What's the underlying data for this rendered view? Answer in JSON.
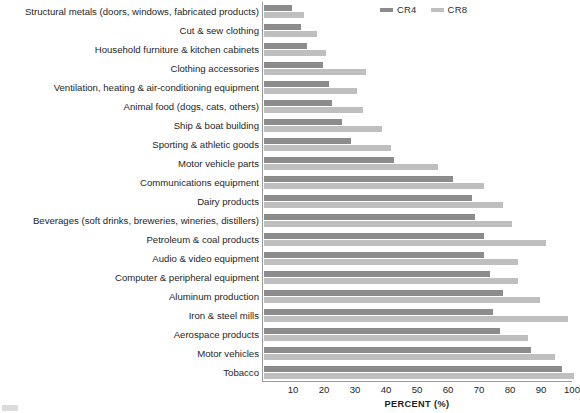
{
  "chart_data": {
    "type": "bar",
    "orientation": "horizontal",
    "title": "",
    "xlabel": "PERCENT (%)",
    "ylabel": "",
    "xlim": [
      0,
      100
    ],
    "xticks": [
      10,
      20,
      30,
      40,
      50,
      60,
      70,
      80,
      90,
      100
    ],
    "grid": false,
    "legend_position": "top-right",
    "colors": {
      "CR4": "#8c8c8c",
      "CR8": "#bfbfbf",
      "axis": "#9a9a9a",
      "text": "#262626"
    },
    "categories": [
      "Structural metals (doors, windows, fabricated products)",
      "Cut & sew clothing",
      "Household furniture & kitchen cabinets",
      "Clothing accessories",
      "Ventilation, heating & air-conditioning equipment",
      "Animal food (dogs, cats, others)",
      "Ship & boat building",
      "Sporting & athletic goods",
      "Motor vehicle parts",
      "Communications equipment",
      "Dairy products",
      "Beverages (soft drinks, breweries, wineries, distillers)",
      "Petroleum & coal products",
      "Audio & video equipment",
      "Computer & peripheral equipment",
      "Aluminum production",
      "Iron & steel mills",
      "Aerospace products",
      "Motor vehicles",
      "Tobacco"
    ],
    "series": [
      {
        "name": "CR4",
        "color": "#8c8c8c",
        "values": [
          9,
          12,
          14,
          19,
          21,
          22,
          25,
          28,
          42,
          61,
          67,
          68,
          71,
          71,
          73,
          77,
          74,
          76,
          86,
          96
        ]
      },
      {
        "name": "CR8",
        "color": "#bfbfbf",
        "values": [
          13,
          17,
          20,
          33,
          30,
          32,
          38,
          41,
          56,
          71,
          77,
          80,
          91,
          82,
          82,
          89,
          98,
          85,
          94,
          100
        ]
      }
    ]
  },
  "legend": {
    "entries": [
      {
        "label": "CR4",
        "color": "#8c8c8c"
      },
      {
        "label": "CR8",
        "color": "#bfbfbf"
      }
    ]
  },
  "axis": {
    "x_title": "PERCENT (%)",
    "x_tick_labels": [
      "10",
      "20",
      "30",
      "40",
      "50",
      "60",
      "70",
      "80",
      "90",
      "100"
    ]
  }
}
